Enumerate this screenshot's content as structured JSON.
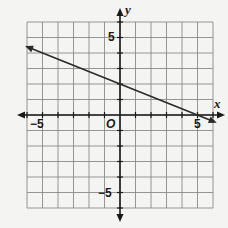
{
  "chart_data": {
    "type": "line",
    "title": "",
    "xlabel": "x",
    "ylabel": "y",
    "xlim": [
      -6,
      6
    ],
    "ylim": [
      -6,
      6
    ],
    "grid": true,
    "grid_step": 1,
    "tick_labels": {
      "x": [
        {
          "value": -5,
          "label": "−5"
        },
        {
          "value": 5,
          "label": "5"
        }
      ],
      "y": [
        {
          "value": 5,
          "label": "5"
        },
        {
          "value": -5,
          "label": "−5"
        }
      ],
      "origin": "O"
    },
    "series": [
      {
        "name": "line",
        "equation": "y = -0.4x + 2",
        "slope": -0.4,
        "intercept": 2,
        "x": [
          -6,
          0,
          5,
          6
        ],
        "y": [
          4.4,
          2,
          0,
          -0.4
        ],
        "arrows": "both"
      }
    ],
    "legend": null
  },
  "colors": {
    "background": "#f4f4f2",
    "grid": "#8a8a8a",
    "axis": "#1a1a1a",
    "line": "#2a2a2a"
  }
}
